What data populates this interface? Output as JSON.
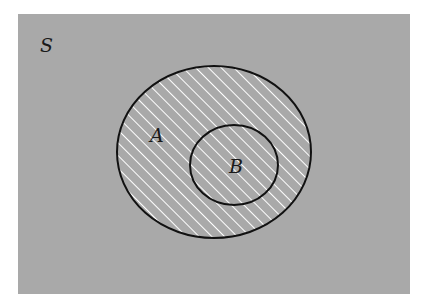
{
  "diagram": {
    "type": "venn",
    "universe_label": "S",
    "sets": [
      {
        "label": "A",
        "shaded": true
      },
      {
        "label": "B",
        "shaded": true,
        "subset_of": "A"
      }
    ],
    "colors": {
      "background": "#a9a9a9",
      "outline": "#111111",
      "hatch": "#ffffff",
      "page": "#ffffff"
    }
  }
}
